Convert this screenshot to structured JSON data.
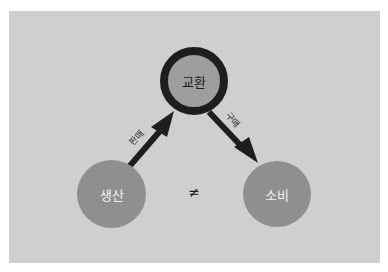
{
  "diagram": {
    "nodes": {
      "exchange": {
        "label": "교환"
      },
      "production": {
        "label": "생산"
      },
      "consumption": {
        "label": "소비"
      }
    },
    "edges": {
      "sell": {
        "from": "production",
        "to": "exchange",
        "label": "판매"
      },
      "buy": {
        "from": "exchange",
        "to": "consumption",
        "label": "구매"
      }
    },
    "relation_symbol": "≠",
    "colors": {
      "panel": "#cfcfcf",
      "node_fill": "#8f8f8f",
      "top_node_fill": "#9e9e9e",
      "ring": "#1e1e1e",
      "arrow": "#1e1e1e"
    }
  }
}
